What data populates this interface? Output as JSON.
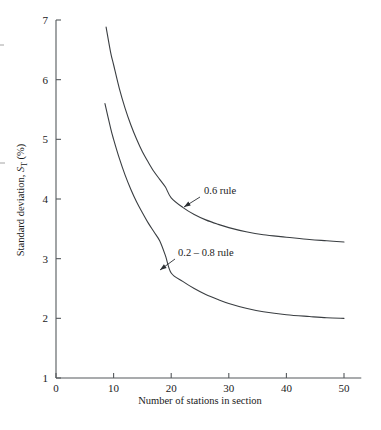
{
  "chart_data": {
    "type": "line",
    "title": "",
    "xlabel": "Number of stations in section",
    "ylabel": "Standard deviation, S_T (%)",
    "ylabel_parts": {
      "main": "Standard deviation, ",
      "symbol": "S",
      "subscript": "T",
      "units": " (%)"
    },
    "xlim": [
      0,
      53
    ],
    "ylim": [
      1,
      7
    ],
    "xticks": [
      0,
      10,
      20,
      30,
      40,
      50
    ],
    "yticks": [
      1,
      2,
      3,
      4,
      5,
      6,
      7
    ],
    "xtick_labels": [
      "0",
      "10",
      "20",
      "30",
      "40",
      "50"
    ],
    "ytick_labels": [
      "1",
      "2",
      "3",
      "4",
      "5",
      "6",
      "7"
    ],
    "grid": false,
    "legend": "none",
    "series": [
      {
        "name": "0.6 rule",
        "label": "0.6 rule",
        "x": [
          8.7,
          9.5,
          10,
          11,
          12,
          13,
          14,
          15,
          16,
          17,
          18,
          19,
          20,
          22,
          24,
          26,
          28,
          30,
          33,
          36,
          40,
          44,
          47,
          50
        ],
        "values": [
          6.88,
          6.45,
          6.25,
          5.85,
          5.52,
          5.24,
          5.0,
          4.79,
          4.62,
          4.46,
          4.33,
          4.2,
          4.02,
          3.86,
          3.74,
          3.65,
          3.58,
          3.52,
          3.45,
          3.4,
          3.36,
          3.32,
          3.3,
          3.28
        ]
      },
      {
        "name": "0.2 - 0.8 rule",
        "label": "0.2 – 0.8 rule",
        "x": [
          8.5,
          9.5,
          10,
          11,
          12,
          13,
          14,
          15,
          16,
          17,
          18,
          19,
          20,
          22,
          24,
          26,
          28,
          30,
          33,
          36,
          40,
          44,
          47,
          50
        ],
        "values": [
          5.6,
          5.18,
          5.0,
          4.68,
          4.4,
          4.16,
          3.95,
          3.77,
          3.6,
          3.45,
          3.3,
          3.05,
          2.76,
          2.62,
          2.5,
          2.4,
          2.32,
          2.25,
          2.17,
          2.11,
          2.06,
          2.03,
          2.01,
          2.0
        ]
      }
    ],
    "annotations": [
      {
        "name": "annotation-0-6-rule",
        "text": "0.6 rule",
        "text_x": 204,
        "text_y": 194,
        "leader_from_x": 200,
        "leader_from_y": 197,
        "leader_to_x": 184,
        "leader_to_y": 207
      },
      {
        "name": "annotation-0-2-0-8-rule",
        "text": "0.2 – 0.8 rule",
        "text_x": 178,
        "text_y": 256,
        "leader_from_x": 175,
        "leader_from_y": 259,
        "leader_to_x": 160,
        "leader_to_y": 270
      }
    ],
    "colors": {
      "curve": "#3a3e42",
      "axis": "#55595c",
      "text": "#1a1a1a",
      "background": "#ffffff"
    }
  }
}
